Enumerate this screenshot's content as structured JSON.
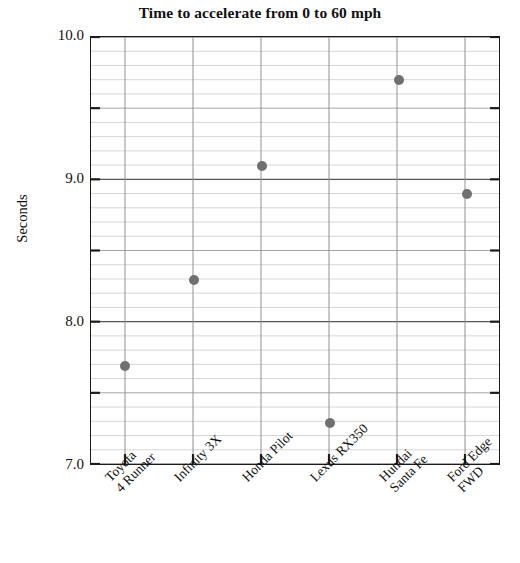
{
  "chart_data": {
    "type": "scatter",
    "title": "Time to accelerate from 0 to 60 mph",
    "xlabel": "",
    "ylabel": "Seconds",
    "categories": [
      "Toyota\n4 Runner",
      "Infinity 3X",
      "Honda Pilot",
      "Lexus RX350",
      "Hundai\nSanta Fe",
      "Ford Edge\nFWD"
    ],
    "values": [
      7.7,
      8.3,
      9.1,
      7.3,
      9.7,
      8.9
    ],
    "ylim": [
      7.0,
      10.0
    ],
    "ytick_labels": [
      "10.0",
      "9.0",
      "8.0",
      "7.0"
    ],
    "ytick_values": [
      10.0,
      9.0,
      8.0,
      7.0
    ],
    "minor_tick_step": 0.1,
    "mid_tick_values": [
      9.5,
      8.5,
      7.5
    ],
    "grid": true,
    "legend": null,
    "marker_color": "#707070",
    "marker_size": 10,
    "axis_color": "#1b1b1b",
    "major_grid_color": "#555555",
    "minor_grid_color": "#c8c8c8"
  },
  "title": {
    "text": "Time to accelerate from 0 to 60 mph"
  },
  "axes": {
    "y_title": "Seconds"
  }
}
